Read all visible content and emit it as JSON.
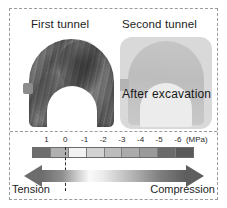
{
  "figure": {
    "plot": {
      "first_tunnel_label": "First tunnel",
      "second_tunnel_label": "Second tunnel",
      "overlay_label": "After excavation"
    },
    "legend": {
      "unit_label": "(MPa)",
      "tension_label": "Tension",
      "compression_label": "Compression",
      "zero_marker_value": "0"
    }
  },
  "chart_data": {
    "type": "heatmap",
    "title": "",
    "subtitle": "",
    "xlabel": "",
    "ylabel": "",
    "panels": [
      {
        "name": "First tunnel",
        "label": "First tunnel",
        "shading": "dark",
        "stress_range_mpa": [
          -6,
          -2
        ]
      },
      {
        "name": "Second tunnel",
        "label": "Second tunnel",
        "shading": "light",
        "annotation": "After excavation",
        "stress_range_mpa": [
          -2,
          0
        ]
      }
    ],
    "colorbar": {
      "unit": "(MPa)",
      "orientation": "horizontal",
      "tick_labels": [
        "1",
        "0",
        "-1",
        "-2",
        "-3",
        "-4",
        "-5",
        "-6"
      ],
      "tick_values": [
        1,
        0,
        -1,
        -2,
        -3,
        -4,
        -5,
        -6
      ],
      "ticks": [
        {
          "label": "1",
          "value": 1,
          "pos_pct": 9.0
        },
        {
          "label": "0",
          "value": 0,
          "pos_pct": 20.5
        },
        {
          "label": "-1",
          "value": -1,
          "pos_pct": 32.5
        },
        {
          "label": "-2",
          "value": -2,
          "pos_pct": 44.0
        },
        {
          "label": "-3",
          "value": -3,
          "pos_pct": 55.5
        },
        {
          "label": "-4",
          "value": -4,
          "pos_pct": 67.0
        },
        {
          "label": "-5",
          "value": -5,
          "pos_pct": 78.5
        },
        {
          "label": "-6",
          "value": -6,
          "pos_pct": 90.0
        }
      ],
      "unit_pos_pct": 95.0,
      "range_mpa": [
        1.5,
        -6.5
      ],
      "segments": [
        {
          "from": 1.5,
          "to": 1.0,
          "color": "#6e6e6e"
        },
        {
          "from": 1.0,
          "to": 0.0,
          "color": "#b0b0b0"
        },
        {
          "from": 0.0,
          "to": -1.0,
          "color": "#f2f2f2"
        },
        {
          "from": -1.0,
          "to": -2.0,
          "color": "#d2d2d2"
        },
        {
          "from": -2.0,
          "to": -3.0,
          "color": "#bcbcbc"
        },
        {
          "from": -3.0,
          "to": -4.0,
          "color": "#ababab"
        },
        {
          "from": -4.0,
          "to": -5.0,
          "color": "#9a9a9a"
        },
        {
          "from": -5.0,
          "to": -6.0,
          "color": "#6b6b6b"
        },
        {
          "from": -6.0,
          "to": -6.5,
          "color": "#5a5a5a"
        }
      ],
      "segment_colors": [
        "#6e6e6e",
        "#b0b0b0",
        "#f2f2f2",
        "#d2d2d2",
        "#bcbcbc",
        "#ababab",
        "#9a9a9a",
        "#6b6b6b",
        "#5a5a5a"
      ]
    },
    "axis_arrow": {
      "left_label": "Tension",
      "right_label": "Compression",
      "zero_position_pct": 20.5,
      "double_headed": true,
      "gradient_from": "#6d6d6d",
      "gradient_mid": "#fafafa",
      "gradient_to": "#5e5e5e"
    },
    "colors": {
      "frame": "#9a9a9a",
      "text": "#1d1d1d",
      "background": "#ffffff"
    }
  }
}
